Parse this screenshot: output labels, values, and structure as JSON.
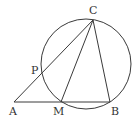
{
  "diagram": {
    "type": "geometry",
    "points": {
      "A": {
        "label": "A",
        "x": 14,
        "y": 102
      },
      "M": {
        "label": "M",
        "x": 61,
        "y": 102
      },
      "B": {
        "label": "B",
        "x": 110,
        "y": 102
      },
      "C": {
        "label": "C",
        "x": 93,
        "y": 20
      },
      "P": {
        "label": "P",
        "x": 42,
        "y": 74
      }
    },
    "segments": [
      [
        "A",
        "B"
      ],
      [
        "A",
        "C"
      ],
      [
        "C",
        "M"
      ],
      [
        "C",
        "B"
      ]
    ],
    "circle": {
      "cx": 86,
      "cy": 64,
      "r": 45,
      "passes_through": [
        "C",
        "P",
        "M",
        "B"
      ]
    },
    "colors": {
      "stroke": "#3a3a3a",
      "label": "#333333",
      "background": "#ffffff"
    }
  }
}
